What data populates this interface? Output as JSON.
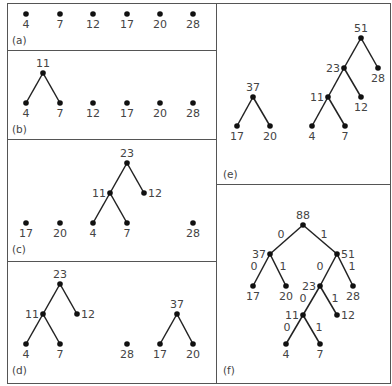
{
  "figure": {
    "panels": [
      {
        "id": "a",
        "label": "(a)",
        "label_pos": [
          12,
          44
        ],
        "nodes": [
          {
            "v": "4",
            "x": 26,
            "y": 14,
            "lp": "below"
          },
          {
            "v": "7",
            "x": 60,
            "y": 14,
            "lp": "below"
          },
          {
            "v": "12",
            "x": 93,
            "y": 14,
            "lp": "below"
          },
          {
            "v": "17",
            "x": 127,
            "y": 14,
            "lp": "below"
          },
          {
            "v": "20",
            "x": 160,
            "y": 14,
            "lp": "below"
          },
          {
            "v": "28",
            "x": 193,
            "y": 14,
            "lp": "below"
          }
        ],
        "edges": []
      },
      {
        "id": "b",
        "label": "(b)",
        "label_pos": [
          12,
          133
        ],
        "nodes": [
          {
            "v": "11",
            "x": 43,
            "y": 73,
            "lp": "above"
          },
          {
            "v": "4",
            "x": 26,
            "y": 103,
            "lp": "below"
          },
          {
            "v": "7",
            "x": 60,
            "y": 103,
            "lp": "below"
          },
          {
            "v": "12",
            "x": 93,
            "y": 103,
            "lp": "below"
          },
          {
            "v": "17",
            "x": 127,
            "y": 103,
            "lp": "below"
          },
          {
            "v": "20",
            "x": 160,
            "y": 103,
            "lp": "below"
          },
          {
            "v": "28",
            "x": 193,
            "y": 103,
            "lp": "below"
          }
        ],
        "edges": [
          [
            0,
            1
          ],
          [
            0,
            2
          ]
        ]
      },
      {
        "id": "c",
        "label": "(c)",
        "label_pos": [
          12,
          253
        ],
        "nodes": [
          {
            "v": "23",
            "x": 127,
            "y": 163,
            "lp": "above"
          },
          {
            "v": "11",
            "x": 110,
            "y": 193,
            "lp": "left"
          },
          {
            "v": "12",
            "x": 144,
            "y": 193,
            "lp": "right"
          },
          {
            "v": "4",
            "x": 93,
            "y": 223,
            "lp": "below"
          },
          {
            "v": "7",
            "x": 127,
            "y": 223,
            "lp": "below"
          },
          {
            "v": "17",
            "x": 26,
            "y": 223,
            "lp": "below"
          },
          {
            "v": "20",
            "x": 60,
            "y": 223,
            "lp": "below"
          },
          {
            "v": "28",
            "x": 193,
            "y": 223,
            "lp": "below"
          }
        ],
        "edges": [
          [
            0,
            1
          ],
          [
            0,
            2
          ],
          [
            1,
            3
          ],
          [
            1,
            4
          ]
        ]
      },
      {
        "id": "d",
        "label": "(d)",
        "label_pos": [
          12,
          374
        ],
        "nodes": [
          {
            "v": "23",
            "x": 60,
            "y": 284,
            "lp": "above"
          },
          {
            "v": "11",
            "x": 43,
            "y": 314,
            "lp": "left"
          },
          {
            "v": "12",
            "x": 77,
            "y": 314,
            "lp": "right"
          },
          {
            "v": "4",
            "x": 26,
            "y": 344,
            "lp": "below"
          },
          {
            "v": "7",
            "x": 60,
            "y": 344,
            "lp": "below"
          },
          {
            "v": "28",
            "x": 127,
            "y": 344,
            "lp": "below"
          },
          {
            "v": "37",
            "x": 177,
            "y": 314,
            "lp": "above"
          },
          {
            "v": "17",
            "x": 160,
            "y": 344,
            "lp": "below"
          },
          {
            "v": "20",
            "x": 193,
            "y": 344,
            "lp": "below"
          }
        ],
        "edges": [
          [
            0,
            1
          ],
          [
            0,
            2
          ],
          [
            1,
            3
          ],
          [
            1,
            4
          ],
          [
            6,
            7
          ],
          [
            6,
            8
          ]
        ]
      },
      {
        "id": "e",
        "label": "(e)",
        "label_pos": [
          223,
          178
        ],
        "nodes": [
          {
            "v": "51",
            "x": 361,
            "y": 38,
            "lp": "above"
          },
          {
            "v": "23",
            "x": 344,
            "y": 68,
            "lp": "left"
          },
          {
            "v": "28",
            "x": 378,
            "y": 68,
            "lp": "below"
          },
          {
            "v": "11",
            "x": 328,
            "y": 97,
            "lp": "left"
          },
          {
            "v": "12",
            "x": 361,
            "y": 97,
            "lp": "below"
          },
          {
            "v": "4",
            "x": 312,
            "y": 126,
            "lp": "below"
          },
          {
            "v": "7",
            "x": 345,
            "y": 126,
            "lp": "below"
          },
          {
            "v": "37",
            "x": 253,
            "y": 97,
            "lp": "above"
          },
          {
            "v": "17",
            "x": 237,
            "y": 126,
            "lp": "below"
          },
          {
            "v": "20",
            "x": 270,
            "y": 126,
            "lp": "below"
          }
        ],
        "edges": [
          [
            0,
            1
          ],
          [
            0,
            2
          ],
          [
            1,
            3
          ],
          [
            1,
            4
          ],
          [
            3,
            5
          ],
          [
            3,
            6
          ],
          [
            7,
            8
          ],
          [
            7,
            9
          ]
        ]
      },
      {
        "id": "f",
        "label": "(f)",
        "label_pos": [
          223,
          374
        ],
        "nodes": [
          {
            "v": "88",
            "x": 303,
            "y": 225,
            "lp": "above"
          },
          {
            "v": "37",
            "x": 270,
            "y": 254,
            "lp": "left"
          },
          {
            "v": "51",
            "x": 337,
            "y": 254,
            "lp": "right"
          },
          {
            "v": "17",
            "x": 253,
            "y": 286,
            "lp": "below"
          },
          {
            "v": "20",
            "x": 286,
            "y": 286,
            "lp": "below"
          },
          {
            "v": "23",
            "x": 320,
            "y": 286,
            "lp": "left"
          },
          {
            "v": "28",
            "x": 353,
            "y": 286,
            "lp": "below"
          },
          {
            "v": "11",
            "x": 303,
            "y": 315,
            "lp": "left"
          },
          {
            "v": "12",
            "x": 337,
            "y": 315,
            "lp": "right"
          },
          {
            "v": "4",
            "x": 286,
            "y": 344,
            "lp": "below"
          },
          {
            "v": "7",
            "x": 320,
            "y": 344,
            "lp": "below"
          }
        ],
        "edges": [
          [
            0,
            1
          ],
          [
            0,
            2
          ],
          [
            1,
            3
          ],
          [
            1,
            4
          ],
          [
            2,
            5
          ],
          [
            2,
            6
          ],
          [
            5,
            7
          ],
          [
            5,
            8
          ],
          [
            7,
            9
          ],
          [
            7,
            10
          ]
        ],
        "bit_labels": [
          {
            "t": "0",
            "x": 281,
            "y": 238
          },
          {
            "t": "1",
            "x": 324,
            "y": 238
          },
          {
            "t": "0",
            "x": 254,
            "y": 270
          },
          {
            "t": "1",
            "x": 283,
            "y": 270
          },
          {
            "t": "0",
            "x": 320,
            "y": 270
          },
          {
            "t": "1",
            "x": 352,
            "y": 270
          },
          {
            "t": "0",
            "x": 303,
            "y": 302
          },
          {
            "t": "1",
            "x": 335,
            "y": 302
          },
          {
            "t": "0",
            "x": 287,
            "y": 331
          },
          {
            "t": "1",
            "x": 319,
            "y": 331
          }
        ]
      }
    ],
    "frame": {
      "outer": [
        7,
        3,
        390,
        383
      ],
      "divider_x": 216,
      "left_rows": [
        50,
        139,
        261
      ],
      "right_rows": [
        184
      ]
    }
  }
}
